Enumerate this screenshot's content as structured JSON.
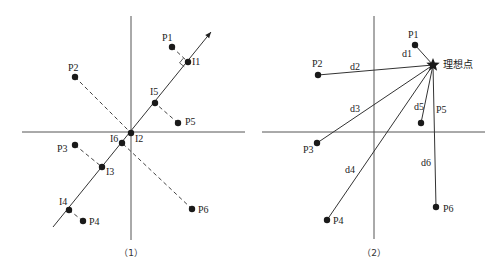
{
  "figure1": {
    "caption": "（1）",
    "axes": {
      "origin": [
        131,
        132
      ],
      "x_from": 22,
      "x_to": 245,
      "y_from": 16,
      "y_to": 240
    },
    "projection_line": {
      "from": [
        53,
        227
      ],
      "to": [
        211,
        32
      ]
    },
    "points": [
      {
        "id": "P1",
        "label": "P1",
        "pos": [
          172,
          47
        ],
        "label_pos": [
          162,
          41
        ]
      },
      {
        "id": "P2",
        "label": "P2",
        "pos": [
          75,
          77
        ],
        "label_pos": [
          68,
          71
        ]
      },
      {
        "id": "P3",
        "label": "P3",
        "pos": [
          75,
          145
        ],
        "label_pos": [
          57,
          152
        ]
      },
      {
        "id": "P4",
        "label": "P4",
        "pos": [
          83,
          221
        ],
        "label_pos": [
          89,
          225
        ]
      },
      {
        "id": "P5",
        "label": "P5",
        "pos": [
          178,
          123
        ],
        "label_pos": [
          185,
          125
        ]
      },
      {
        "id": "P6",
        "label": "P6",
        "pos": [
          192,
          209
        ],
        "label_pos": [
          198,
          213
        ]
      }
    ],
    "projections": [
      {
        "id": "I1",
        "label": "I1",
        "pos": [
          188,
          62
        ],
        "label_pos": [
          192,
          65
        ],
        "from": "P1"
      },
      {
        "id": "I2",
        "label": "I2",
        "pos": [
          131,
          133
        ],
        "label_pos": [
          135,
          142
        ],
        "from": "P2"
      },
      {
        "id": "I3",
        "label": "I3",
        "pos": [
          102,
          167
        ],
        "label_pos": [
          106,
          175
        ],
        "from": "P3"
      },
      {
        "id": "I4",
        "label": "I4",
        "pos": [
          69,
          210
        ],
        "label_pos": [
          59,
          205
        ],
        "from": "P4"
      },
      {
        "id": "I5",
        "label": "I5",
        "pos": [
          155,
          103
        ],
        "label_pos": [
          150,
          95
        ],
        "from": "P5"
      },
      {
        "id": "I6",
        "label": "I6",
        "pos": [
          122,
          143
        ],
        "label_pos": [
          110,
          142
        ],
        "from": "P6"
      }
    ]
  },
  "figure2": {
    "caption": "（2）",
    "axes": {
      "origin": [
        374,
        132
      ],
      "x_from": 262,
      "x_to": 485,
      "y_from": 16,
      "y_to": 239
    },
    "ideal_point": {
      "label": "理想点",
      "pos": [
        433,
        65
      ],
      "label_pos": [
        443,
        68
      ]
    },
    "points": [
      {
        "id": "P1",
        "label": "P1",
        "pos": [
          415,
          45
        ],
        "label_pos": [
          408,
          38
        ]
      },
      {
        "id": "P2",
        "label": "P2",
        "pos": [
          318,
          75
        ],
        "label_pos": [
          312,
          67
        ]
      },
      {
        "id": "P3",
        "label": "P3",
        "pos": [
          317,
          143
        ],
        "label_pos": [
          303,
          153
        ]
      },
      {
        "id": "P4",
        "label": "P4",
        "pos": [
          327,
          220
        ],
        "label_pos": [
          333,
          224
        ]
      },
      {
        "id": "P5",
        "label": "P5",
        "pos": [
          421,
          123
        ],
        "label_pos": [
          436,
          113
        ]
      },
      {
        "id": "P6",
        "label": "P6",
        "pos": [
          436,
          207
        ],
        "label_pos": [
          443,
          212
        ]
      }
    ],
    "distances": [
      {
        "label": "d1",
        "to": "P1",
        "label_pos": [
          402,
          57
        ]
      },
      {
        "label": "d2",
        "to": "P2",
        "label_pos": [
          350,
          70
        ]
      },
      {
        "label": "d3",
        "to": "P3",
        "label_pos": [
          350,
          112
        ]
      },
      {
        "label": "d4",
        "to": "P4",
        "label_pos": [
          345,
          173
        ]
      },
      {
        "label": "d5",
        "to": "P5",
        "label_pos": [
          414,
          110
        ]
      },
      {
        "label": "d6",
        "to": "P6",
        "label_pos": [
          421,
          166
        ]
      }
    ]
  }
}
